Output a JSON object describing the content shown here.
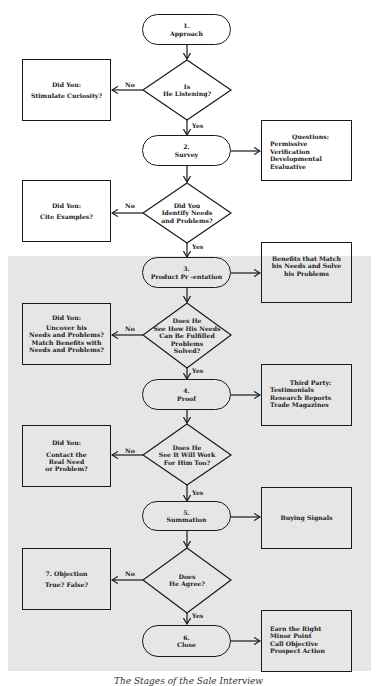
{
  "flowchart": {
    "steps": [
      {
        "number": "1.",
        "label": "Approach"
      },
      {
        "number": "2.",
        "label": "Survey"
      },
      {
        "number": "3.",
        "label": "Product Pr -entation"
      },
      {
        "number": "4.",
        "label": "Proof"
      },
      {
        "number": "5.",
        "label": "Summation"
      },
      {
        "number": "6.",
        "label": "Close"
      }
    ],
    "decisions": [
      {
        "lines": [
          "Is",
          "He Listening?"
        ],
        "yes": "Yes",
        "no": "No"
      },
      {
        "lines": [
          "Did You",
          "Identify Needs",
          "and Problems?"
        ],
        "yes": "Yes",
        "no": "No"
      },
      {
        "lines": [
          "Does He",
          "See How His Needs",
          "Can Be Fulfilled",
          "Problems",
          "Solved?"
        ],
        "yes": "Yes",
        "no": "No"
      },
      {
        "lines": [
          "Does He",
          "See It Will Work",
          "For Him Too?"
        ],
        "yes": "Yes",
        "no": "No"
      },
      {
        "lines": [
          "Does",
          "He Agree?"
        ],
        "yes": "Yes",
        "no": "No"
      }
    ],
    "left_boxes": [
      {
        "heading": "Did You:",
        "lines": [
          "Stimulate Curiosity?"
        ]
      },
      {
        "heading": "Did You:",
        "lines": [
          "Cite Examples?"
        ]
      },
      {
        "heading": "Did You:",
        "lines": [
          "Uncover his",
          "Needs and Problems?",
          "Match Benefits with",
          "Needs and Problems?"
        ]
      },
      {
        "heading": "Did You:",
        "lines": [
          "Contact the",
          "Real Need",
          "or Problem?"
        ]
      },
      {
        "heading": "7.  Objection",
        "lines": [
          "True?  False?"
        ]
      }
    ],
    "right_boxes": [
      {
        "heading": "Questions:",
        "lines": [
          "Permissive",
          "Verification",
          "Developmental",
          "Evaluative"
        ]
      },
      {
        "heading": "",
        "lines": [
          "Benefits that Match",
          "his Needs and Solve",
          "his Problems"
        ]
      },
      {
        "heading": "Third Party:",
        "lines": [
          "Testimonials",
          "Research Reports",
          "Trade Magazines"
        ]
      },
      {
        "heading": "",
        "lines": [
          "Buying Signals"
        ]
      },
      {
        "heading": "",
        "lines": [
          "Earn the Right",
          "Minor Point",
          "Call Objective",
          "Prospect Action"
        ]
      }
    ]
  },
  "caption": "The Stages of the Sale Interview"
}
